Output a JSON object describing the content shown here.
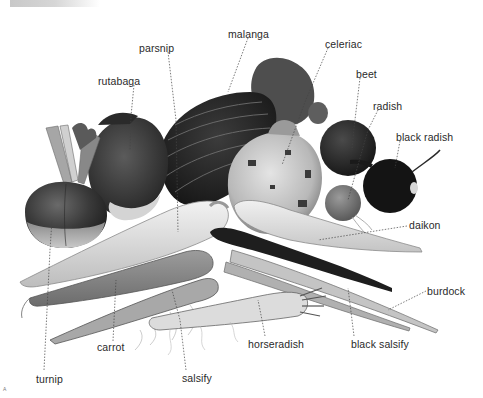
{
  "diagram": {
    "style": "grayscale botanical illustration with dotted leader lines",
    "labels": [
      {
        "id": "parsnip",
        "text": "parsnip",
        "x": 139,
        "y": 42
      },
      {
        "id": "malanga",
        "text": "malanga",
        "x": 228,
        "y": 28
      },
      {
        "id": "celeriac",
        "text": "celeriac",
        "x": 325,
        "y": 38
      },
      {
        "id": "rutabaga",
        "text": "rutabaga",
        "x": 98,
        "y": 75
      },
      {
        "id": "beet",
        "text": "beet",
        "x": 356,
        "y": 68
      },
      {
        "id": "radish",
        "text": "radish",
        "x": 373,
        "y": 100
      },
      {
        "id": "black-radish",
        "text": "black radish",
        "x": 396,
        "y": 131
      },
      {
        "id": "daikon",
        "text": "daikon",
        "x": 409,
        "y": 219
      },
      {
        "id": "burdock",
        "text": "burdock",
        "x": 427,
        "y": 285
      },
      {
        "id": "black-salsify",
        "text": "black salsify",
        "x": 351,
        "y": 338
      },
      {
        "id": "horseradish",
        "text": "horseradish",
        "x": 248,
        "y": 338
      },
      {
        "id": "carrot",
        "text": "carrot",
        "x": 97,
        "y": 341
      },
      {
        "id": "salsify",
        "text": "salsify",
        "x": 182,
        "y": 372
      },
      {
        "id": "turnip",
        "text": "turnip",
        "x": 36,
        "y": 373
      }
    ],
    "signature": "A"
  }
}
